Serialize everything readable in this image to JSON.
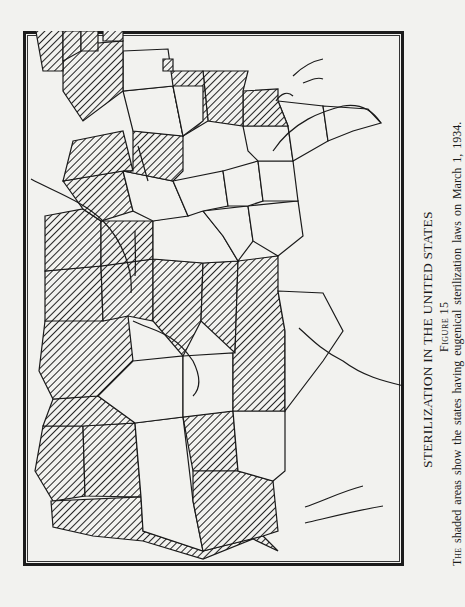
{
  "figure": {
    "title": "STERILIZATION IN THE UNITED STATES",
    "figure_label": "Figure 15",
    "caption_lead": "The",
    "caption_rest": " shaded areas show the states having eugenical sterilization laws on March 1, 1934.",
    "orientation": "rotated 90° counter-clockwise (north to the left)"
  },
  "map": {
    "subject": "United States",
    "legend": {
      "shaded": "state with eugenical sterilization law (as of March 1, 1934)",
      "unshaded": "state without such law"
    },
    "colors": {
      "paper": "#f2f2ef",
      "ink": "#1a1a1a"
    },
    "states": [
      {
        "name": "Washington",
        "shaded": true
      },
      {
        "name": "Oregon",
        "shaded": true
      },
      {
        "name": "California",
        "shaded": true
      },
      {
        "name": "Idaho",
        "shaded": true
      },
      {
        "name": "Nevada",
        "shaded": false
      },
      {
        "name": "Utah",
        "shaded": true
      },
      {
        "name": "Arizona",
        "shaded": true
      },
      {
        "name": "Montana",
        "shaded": true
      },
      {
        "name": "Wyoming",
        "shaded": false
      },
      {
        "name": "Colorado",
        "shaded": false
      },
      {
        "name": "New Mexico",
        "shaded": false
      },
      {
        "name": "North Dakota",
        "shaded": true
      },
      {
        "name": "South Dakota",
        "shaded": true
      },
      {
        "name": "Nebraska",
        "shaded": true
      },
      {
        "name": "Kansas",
        "shaded": true
      },
      {
        "name": "Oklahoma",
        "shaded": true
      },
      {
        "name": "Texas",
        "shaded": false
      },
      {
        "name": "Minnesota",
        "shaded": true
      },
      {
        "name": "Iowa",
        "shaded": true
      },
      {
        "name": "Missouri",
        "shaded": false
      },
      {
        "name": "Arkansas",
        "shaded": false
      },
      {
        "name": "Louisiana",
        "shaded": false
      },
      {
        "name": "Wisconsin",
        "shaded": true
      },
      {
        "name": "Illinois",
        "shaded": false
      },
      {
        "name": "Michigan",
        "shaded": true
      },
      {
        "name": "Indiana",
        "shaded": true
      },
      {
        "name": "Ohio",
        "shaded": false
      },
      {
        "name": "Kentucky",
        "shaded": false
      },
      {
        "name": "Tennessee",
        "shaded": false
      },
      {
        "name": "Mississippi",
        "shaded": false
      },
      {
        "name": "Alabama",
        "shaded": false
      },
      {
        "name": "Georgia",
        "shaded": false
      },
      {
        "name": "Florida",
        "shaded": false
      },
      {
        "name": "South Carolina",
        "shaded": true
      },
      {
        "name": "North Carolina",
        "shaded": true
      },
      {
        "name": "Virginia",
        "shaded": true
      },
      {
        "name": "West Virginia",
        "shaded": false
      },
      {
        "name": "Pennsylvania",
        "shaded": false
      },
      {
        "name": "New York",
        "shaded": true
      },
      {
        "name": "Maine",
        "shaded": true
      },
      {
        "name": "New Hampshire",
        "shaded": true
      },
      {
        "name": "Vermont",
        "shaded": true
      },
      {
        "name": "Delaware",
        "shaded": true
      },
      {
        "name": "Connecticut",
        "shaded": true
      }
    ]
  }
}
